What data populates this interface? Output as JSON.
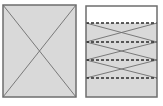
{
  "figure": {
    "name": "two-panel-schematic-diagram",
    "background_color": "#ffffff",
    "width": 163,
    "height": 106,
    "panels": [
      {
        "id": "left-panel",
        "name": "crossed-rectangle-panel",
        "label": "",
        "x": 3,
        "y": 5,
        "width": 73,
        "height": 92,
        "fill_color": "#d9d9d9",
        "stroke_color": "#6e6e6e",
        "stroke_width": 1.5,
        "top_fill_color": "#d9d9d9",
        "diagonals": [
          {
            "name": "diagonal-down-right",
            "x1": 3,
            "y1": 5,
            "x2": 76,
            "y2": 97
          },
          {
            "name": "diagonal-up-right",
            "x1": 3,
            "y1": 97,
            "x2": 76,
            "y2": 5
          }
        ],
        "dashed_lines": []
      },
      {
        "id": "right-panel",
        "name": "layered-crossed-rectangle-panel",
        "label": "",
        "x": 86,
        "y": 6,
        "width": 71,
        "height": 91,
        "fill_color": "#d9d9d9",
        "stroke_color": "#6e6e6e",
        "stroke_width": 1.5,
        "top_fill_color": "#ffffff",
        "top_fill_to_y": 23,
        "dashed_lines": [
          {
            "name": "dashed-line-1",
            "y": 23
          },
          {
            "name": "dashed-line-2",
            "y": 42
          },
          {
            "name": "dashed-line-3",
            "y": 60
          },
          {
            "name": "dashed-line-4",
            "y": 78
          }
        ],
        "dash_pattern": "3 2",
        "dash_color": "#2b2b2b",
        "dash_width": 1.6,
        "cross_bands": [
          {
            "name": "cross-band-1",
            "top": 23,
            "bottom": 42
          },
          {
            "name": "cross-band-2",
            "top": 42,
            "bottom": 60
          },
          {
            "name": "cross-band-3",
            "top": 60,
            "bottom": 78
          }
        ],
        "diagonals": []
      }
    ]
  }
}
